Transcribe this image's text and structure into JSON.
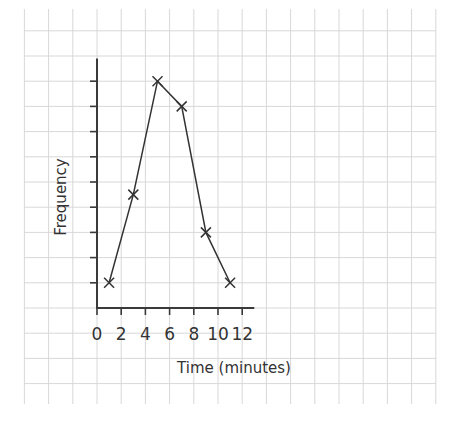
{
  "chart_data": {
    "type": "line",
    "title": "",
    "xlabel": "Time (minutes)",
    "ylabel": "Frequency",
    "x": [
      1,
      3,
      5,
      7,
      9,
      11
    ],
    "series": [
      {
        "name": "Frequency",
        "values": [
          1,
          4.5,
          9,
          8,
          3,
          1
        ],
        "marker": "x"
      }
    ],
    "xlim": [
      0,
      13
    ],
    "ylim": [
      0,
      9.9
    ],
    "xticks": [
      0,
      2,
      4,
      6,
      8,
      10,
      12
    ],
    "xtick_labels": [
      "0",
      "2",
      "4",
      "6",
      "8",
      "10",
      "12"
    ],
    "yticks": [
      1,
      2,
      3,
      4,
      5,
      6,
      7,
      8,
      9
    ],
    "ytick_labels": [],
    "grid": true,
    "background": "graph-paper",
    "colors": {
      "line": "#333333",
      "axis": "#3a3a3a",
      "grid": "#d8d8d8"
    }
  }
}
